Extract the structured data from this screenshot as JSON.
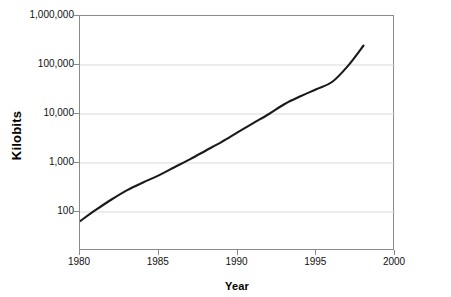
{
  "chart_data": {
    "type": "line",
    "title": "",
    "subtitle": "",
    "xlabel": "Year",
    "ylabel": "Kilobits",
    "xlim": [
      1980,
      2000
    ],
    "ylim": [
      16,
      1000000
    ],
    "yscale": "log",
    "xscale": "linear",
    "grid": "horizontal",
    "legend": "none",
    "xticks": [
      {
        "value": 1980,
        "label": "1980"
      },
      {
        "value": 1985,
        "label": "1985"
      },
      {
        "value": 1990,
        "label": "1990"
      },
      {
        "value": 1995,
        "label": "1995"
      },
      {
        "value": 2000,
        "label": "2000"
      }
    ],
    "yticks": [
      {
        "value": 100,
        "label": "100"
      },
      {
        "value": 1000,
        "label": "1,000"
      },
      {
        "value": 10000,
        "label": "10,000"
      },
      {
        "value": 100000,
        "label": "100,000"
      },
      {
        "value": 1000000,
        "label": "1,000,000"
      }
    ],
    "series": [
      {
        "name": "Kilobits",
        "color": "#1a1a1a",
        "x": [
          1980,
          1981,
          1982,
          1983,
          1984,
          1985,
          1986,
          1987,
          1988,
          1989,
          1990,
          1991,
          1992,
          1993,
          1994,
          1995,
          1996,
          1997,
          1998
        ],
        "values": [
          65,
          110,
          180,
          280,
          400,
          560,
          820,
          1200,
          1800,
          2700,
          4200,
          6500,
          10000,
          16000,
          23000,
          32000,
          45000,
          95000,
          250000
        ]
      }
    ],
    "annotations": []
  },
  "axis": {
    "x_title": "Year",
    "y_title": "Kilobits"
  },
  "colors": {
    "series": "#1a1a1a",
    "grid": "#d9d9d9",
    "axis": "#8a8a8a",
    "background": "#ffffff",
    "text": "#111111"
  }
}
